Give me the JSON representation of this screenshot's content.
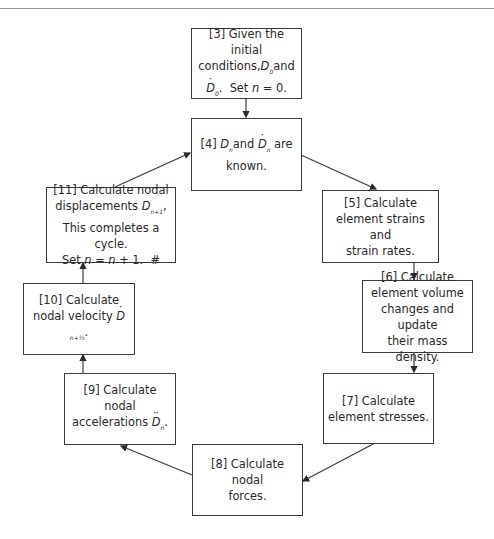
{
  "diagram": {
    "type": "flowchart-cycle",
    "nodes": [
      {
        "id": "3",
        "label": "[3] Given the initial conditions, D0 and Ḋ0. Set n = 0.",
        "line1": "[3] Given the initial",
        "line2a": "conditions,",
        "line2sym": "D",
        "line2sub": "0",
        "line2b": "and",
        "line3sym": "D",
        "line3sub": "0",
        "line3b": ".  Set ",
        "line3n": "n",
        "line3c": " = 0."
      },
      {
        "id": "4",
        "label": "[4] Dn and Ḋn are known.",
        "pre": "[4] ",
        "sym1": "D",
        "sub1": "n",
        "mid": "and ",
        "sym2": "D",
        "sub2": "n",
        "post": " are",
        "line2": "known."
      },
      {
        "id": "5",
        "label": "[5] Calculate element strains and strain rates.",
        "line1": "[5] Calculate",
        "line2": "element strains and",
        "line3": "strain rates."
      },
      {
        "id": "6",
        "label": "[6] Calculate element volume changes and update their mass density.",
        "line1": "[6] Calculate",
        "line2": "element volume",
        "line3": "changes and update",
        "line4": "their mass density."
      },
      {
        "id": "7",
        "label": "[7] Calculate element stresses.",
        "line1": "[7] Calculate",
        "line2": "element stresses."
      },
      {
        "id": "8",
        "label": "[8] Calculate nodal forces.",
        "line1": "[8] Calculate nodal",
        "line2": "forces."
      },
      {
        "id": "9",
        "label": "[9] Calculate nodal accelerations D̈n.",
        "line1": "[9] Calculate nodal",
        "line2": "accelerations ",
        "sym": "D",
        "sub": "n",
        "post": "."
      },
      {
        "id": "10",
        "label": "[10] Calculate nodal velocity Ḋ(n+1/2).",
        "line1": "[10] Calculate",
        "line2": "nodal velocity ",
        "sym": "D",
        "sub": "n+½",
        "post": "."
      },
      {
        "id": "11",
        "label": "[11] Calculate nodal displacements Dn+1. This completes a cycle. Set n = n + 1. #",
        "line1": "[11] Calculate nodal",
        "line2": "displacements ",
        "sym": "D",
        "sub": "n+1",
        "post": ",",
        "line3": "This completes a cycle.",
        "line4a": "Set ",
        "line4n": "n",
        "line4b": " = ",
        "line4n2": "n",
        "line4c": " + 1.  #"
      }
    ],
    "edges": [
      {
        "from": "3",
        "to": "4"
      },
      {
        "from": "4",
        "to": "5"
      },
      {
        "from": "5",
        "to": "6"
      },
      {
        "from": "6",
        "to": "7"
      },
      {
        "from": "7",
        "to": "8"
      },
      {
        "from": "8",
        "to": "9"
      },
      {
        "from": "9",
        "to": "10"
      },
      {
        "from": "10",
        "to": "11"
      },
      {
        "from": "11",
        "to": "4"
      }
    ],
    "colors": {
      "stroke": "#3a3a3a",
      "text": "#2a2a2a",
      "background": "#ffffff"
    }
  }
}
